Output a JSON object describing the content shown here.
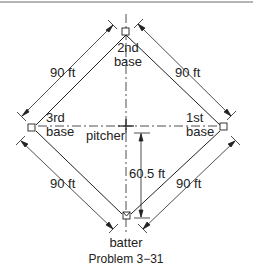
{
  "figure": {
    "caption": "Problem 3−31",
    "bases": {
      "second": [
        "2nd",
        "base"
      ],
      "third": [
        "3rd",
        "base"
      ],
      "first": [
        "1st",
        "base"
      ],
      "home": "batter"
    },
    "pitcher_label": "pitcher",
    "dimensions": {
      "home_to_third": "90 ft",
      "third_to_second": "90 ft",
      "second_to_first": "90 ft",
      "first_to_home": "90 ft",
      "pitcher_to_home": "60.5 ft"
    },
    "colors": {
      "ink": "#222222",
      "frame": "#9a9a9a"
    }
  }
}
